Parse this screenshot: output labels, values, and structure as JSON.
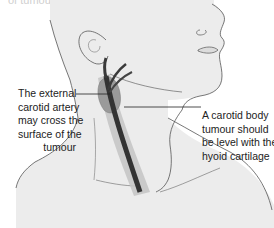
{
  "figure": {
    "top_fragment_text": "of tumour.",
    "colors": {
      "skin": "#ececec",
      "outline": "#555555",
      "carotid_dark": "#3a3a3a",
      "carotid_mid": "#6e6e6e",
      "tumour": "#9a9a9a",
      "vessel_sheath": "#c4c4c4",
      "label_text": "#222222",
      "leader_line": "#222222"
    },
    "annotations": [
      {
        "id": "external-carotid",
        "lines": [
          "The external",
          "carotid artery",
          "may cross the",
          "surface of the",
          "tumour"
        ]
      },
      {
        "id": "carotid-body-tumour-level",
        "lines": [
          "A carotid body",
          "tumour should",
          "be level with the",
          "hyoid cartilage"
        ]
      }
    ]
  }
}
